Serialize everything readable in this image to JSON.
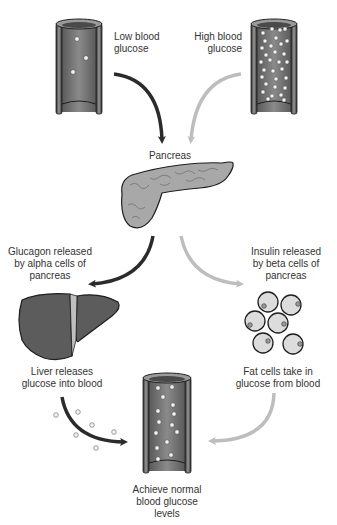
{
  "diagram": {
    "colors": {
      "dark_arrow": "#2b2b2b",
      "light_arrow": "#bdbdbd",
      "vessel_fill": "#6e6e6e",
      "vessel_edge": "#1f1f1f",
      "glucose_dot": "#f2f2f2",
      "pancreas_fill": "#a8a8a8",
      "liver_fill": "#5c5c5c",
      "fat_cell_fill": "#dcdcdc"
    },
    "nodes": {
      "low_glucose": {
        "lines": [
          "Low blood",
          "glucose"
        ]
      },
      "high_glucose": {
        "lines": [
          "High blood",
          "glucose"
        ]
      },
      "pancreas": {
        "lines": [
          "Pancreas"
        ]
      },
      "glucagon": {
        "lines": [
          "Glucagon released",
          "by alpha cells of",
          "pancreas"
        ]
      },
      "insulin": {
        "lines": [
          "Insulin released",
          "by beta cells of",
          "pancreas"
        ]
      },
      "liver": {
        "lines": [
          "Liver releases",
          "glucose into blood"
        ]
      },
      "fat_cells": {
        "lines": [
          "Fat cells take in",
          "glucose from blood"
        ]
      },
      "normal": {
        "lines": [
          "Achieve normal",
          "blood glucose",
          "levels"
        ]
      }
    },
    "edges": [
      {
        "from": "low_glucose",
        "to": "pancreas",
        "style": "dark"
      },
      {
        "from": "high_glucose",
        "to": "pancreas",
        "style": "light"
      },
      {
        "from": "pancreas",
        "to": "glucagon",
        "style": "dark"
      },
      {
        "from": "pancreas",
        "to": "insulin",
        "style": "light"
      },
      {
        "from": "liver",
        "to": "normal",
        "style": "dark"
      },
      {
        "from": "fat_cells",
        "to": "normal",
        "style": "light"
      }
    ],
    "icons": {
      "low_vessel": "blood-vessel-low-glucose-icon",
      "high_vessel": "blood-vessel-high-glucose-icon",
      "pancreas": "pancreas-icon",
      "liver": "liver-icon",
      "fat_cells": "fat-cells-icon",
      "normal_vessel": "blood-vessel-normal-glucose-icon"
    }
  }
}
